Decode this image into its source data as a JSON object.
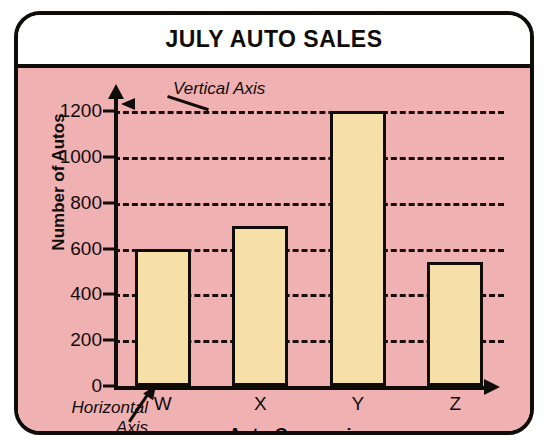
{
  "chart_data": {
    "type": "bar",
    "title": "JULY AUTO SALES",
    "xlabel": "Auto Companies",
    "ylabel": "Number of Autos",
    "categories": [
      "W",
      "X",
      "Y",
      "Z"
    ],
    "values": [
      600,
      700,
      1200,
      540
    ],
    "ylim": [
      0,
      1200
    ],
    "yticks": [
      0,
      200,
      400,
      600,
      800,
      1000,
      1200
    ],
    "ytick_labels": [
      "0",
      "200",
      "400",
      "600",
      "800",
      "1000",
      "1200"
    ],
    "grid": true,
    "grid_style": "dashed",
    "legend": null,
    "annotations": [
      {
        "text": "Vertical Axis",
        "points_to": "y-axis",
        "style": "italic"
      },
      {
        "text": "Horizontal\nAxis",
        "points_to": "x-axis",
        "style": "italic"
      }
    ],
    "colors": {
      "bar_fill": "#F6E0A8",
      "bar_edge": "#100C0A",
      "panel_background": "#F0B1B3",
      "title_background": "#FFFFFF",
      "axis": "#100C0A",
      "grid": "#1A0F0C"
    }
  },
  "annotations": {
    "vertical_axis": "Vertical Axis",
    "horizontal_axis": "Horizontal\nAxis"
  }
}
